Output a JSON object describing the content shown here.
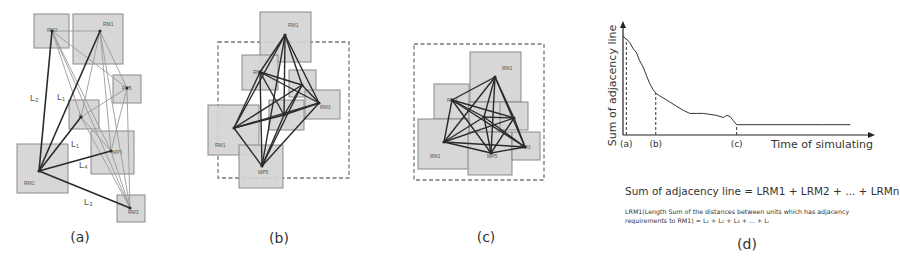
{
  "figure": {
    "colors": {
      "room_fill": "#d4d4d4",
      "room_stroke": "#8a8a8a",
      "edge_dark": "#2a2a2a",
      "edge_light": "#9a9a9a",
      "boundary": "#777777"
    },
    "panels": [
      {
        "id": "a",
        "caption": "(a)",
        "rooms": [
          {
            "label": "RM2",
            "x": 34,
            "y": 14,
            "w": 35,
            "h": 34,
            "lx": 47,
            "ly": 32
          },
          {
            "label": "RM1",
            "x": 73,
            "y": 14,
            "w": 50,
            "h": 50,
            "lx": 103,
            "ly": 26
          },
          {
            "label": "PV5",
            "x": 113,
            "y": 75,
            "w": 28,
            "h": 28,
            "lx": 122,
            "ly": 90
          },
          {
            "label": "B",
            "x": 69,
            "y": 100,
            "w": 30,
            "h": 29,
            "lx": 79,
            "ly": 118
          },
          {
            "label": "MP5",
            "x": 91,
            "y": 131,
            "w": 43,
            "h": 43,
            "lx": 112,
            "ly": 154
          },
          {
            "label": "RM1",
            "x": 17,
            "y": 144,
            "w": 51,
            "h": 49,
            "lx": 24,
            "ly": 185
          },
          {
            "label": "RM3",
            "x": 117,
            "y": 195,
            "w": 28,
            "h": 27,
            "lx": 128,
            "ly": 214
          }
        ],
        "nodes": [
          [
            52,
            31
          ],
          [
            100,
            31
          ],
          [
            127,
            88
          ],
          [
            81,
            117
          ],
          [
            111,
            151
          ],
          [
            39,
            171
          ],
          [
            130,
            208
          ]
        ],
        "dark_edges": [
          [
            5,
            0
          ],
          [
            5,
            1
          ],
          [
            5,
            3
          ],
          [
            5,
            4
          ],
          [
            5,
            6
          ]
        ],
        "light_edges": [
          [
            0,
            1
          ],
          [
            0,
            2
          ],
          [
            0,
            4
          ],
          [
            0,
            6
          ],
          [
            0,
            3
          ],
          [
            1,
            2
          ],
          [
            1,
            3
          ],
          [
            1,
            4
          ],
          [
            1,
            6
          ],
          [
            2,
            3
          ],
          [
            2,
            4
          ],
          [
            2,
            6
          ],
          [
            3,
            6
          ],
          [
            4,
            6
          ],
          [
            3,
            4
          ]
        ],
        "length_labels": [
          {
            "text": "L₂",
            "x": 30,
            "y": 101
          },
          {
            "text": "L₁",
            "x": 57,
            "y": 100
          },
          {
            "text": "L₁",
            "x": 71,
            "y": 147
          },
          {
            "text": "L₄",
            "x": 79,
            "y": 168
          },
          {
            "text": "L₃",
            "x": 84,
            "y": 205
          }
        ]
      },
      {
        "id": "b",
        "caption": "(b)",
        "boundary": {
          "x": 218,
          "y": 42,
          "w": 131,
          "h": 136
        },
        "rooms": [
          {
            "label": "RM1",
            "x": 260,
            "y": 12,
            "w": 51,
            "h": 50,
            "lx": 288,
            "ly": 27
          },
          {
            "label": "RM2",
            "x": 242,
            "y": 55,
            "w": 36,
            "h": 35,
            "lx": 253,
            "ly": 74
          },
          {
            "label": "",
            "x": 289,
            "y": 70,
            "w": 27,
            "h": 27,
            "lx": 0,
            "ly": 0
          },
          {
            "label": "RM3",
            "x": 305,
            "y": 90,
            "w": 35,
            "h": 29,
            "lx": 320,
            "ly": 109
          },
          {
            "label": "",
            "x": 269,
            "y": 100,
            "w": 35,
            "h": 30,
            "lx": 0,
            "ly": 0
          },
          {
            "label": "RM1",
            "x": 208,
            "y": 105,
            "w": 51,
            "h": 50,
            "lx": 215,
            "ly": 147
          },
          {
            "label": "MP5",
            "x": 239,
            "y": 145,
            "w": 44,
            "h": 43,
            "lx": 258,
            "ly": 174
          }
        ],
        "nodes": [
          [
            285,
            35
          ],
          [
            260,
            72
          ],
          [
            302,
            85
          ],
          [
            319,
            103
          ],
          [
            284,
            115
          ],
          [
            234,
            128
          ],
          [
            262,
            166
          ]
        ],
        "dark_edges": [
          [
            0,
            1
          ],
          [
            0,
            2
          ],
          [
            0,
            3
          ],
          [
            0,
            4
          ],
          [
            0,
            5
          ],
          [
            0,
            6
          ],
          [
            1,
            2
          ],
          [
            1,
            3
          ],
          [
            1,
            4
          ],
          [
            1,
            5
          ],
          [
            1,
            6
          ],
          [
            2,
            3
          ],
          [
            2,
            4
          ],
          [
            2,
            5
          ],
          [
            2,
            6
          ],
          [
            3,
            4
          ],
          [
            3,
            5
          ],
          [
            3,
            6
          ],
          [
            4,
            5
          ],
          [
            4,
            6
          ],
          [
            5,
            6
          ]
        ],
        "light_edges": []
      },
      {
        "id": "c",
        "caption": "(c)",
        "boundary": {
          "x": 414,
          "y": 44,
          "w": 130,
          "h": 136
        },
        "rooms": [
          {
            "label": "RM1",
            "x": 470,
            "y": 52,
            "w": 51,
            "h": 50,
            "lx": 502,
            "ly": 70
          },
          {
            "label": "RM2",
            "x": 434,
            "y": 84,
            "w": 35,
            "h": 35,
            "lx": 447,
            "ly": 102
          },
          {
            "label": "",
            "x": 469,
            "y": 102,
            "w": 35,
            "h": 30,
            "lx": 0,
            "ly": 0
          },
          {
            "label": "",
            "x": 500,
            "y": 102,
            "w": 28,
            "h": 28,
            "lx": 0,
            "ly": 0
          },
          {
            "label": "RM1",
            "x": 418,
            "y": 119,
            "w": 51,
            "h": 50,
            "lx": 430,
            "ly": 158
          },
          {
            "label": "MP5",
            "x": 468,
            "y": 132,
            "w": 44,
            "h": 43,
            "lx": 487,
            "ly": 158
          },
          {
            "label": "RM3",
            "x": 512,
            "y": 132,
            "w": 28,
            "h": 28,
            "lx": 520,
            "ly": 149
          }
        ],
        "nodes": [
          [
            495,
            77
          ],
          [
            452,
            100
          ],
          [
            484,
            117
          ],
          [
            514,
            118
          ],
          [
            444,
            142
          ],
          [
            491,
            153
          ],
          [
            525,
            147
          ]
        ],
        "dark_edges": [
          [
            0,
            1
          ],
          [
            0,
            2
          ],
          [
            0,
            3
          ],
          [
            0,
            4
          ],
          [
            0,
            5
          ],
          [
            0,
            6
          ],
          [
            1,
            2
          ],
          [
            1,
            3
          ],
          [
            1,
            4
          ],
          [
            1,
            5
          ],
          [
            1,
            6
          ],
          [
            2,
            3
          ],
          [
            2,
            4
          ],
          [
            2,
            5
          ],
          [
            2,
            6
          ],
          [
            3,
            4
          ],
          [
            3,
            5
          ],
          [
            3,
            6
          ],
          [
            4,
            5
          ],
          [
            4,
            6
          ],
          [
            5,
            6
          ]
        ],
        "light_edges": []
      }
    ],
    "panel_d_caption": "(d)",
    "formula_main": "Sum of adjacency line = LRM1 + LRM2 + ... + LRMn",
    "formula_sub": "LRM1(Length Sum of the distances between units which has adjacency requirements to RM1) = L₁ + L₂ + L₃ + ... + Lᵢ"
  },
  "chart_data": {
    "type": "line",
    "title": "",
    "xlabel": "Time of simulating",
    "ylabel": "Sum of adjacency line",
    "grid": false,
    "x_ticks": [
      {
        "label": "(a)",
        "x": 0.05
      },
      {
        "label": "(b)",
        "x": 0.49
      },
      {
        "label": "(c)",
        "x": 1.7
      }
    ],
    "xlim": [
      0,
      3.65
    ],
    "ylim": [
      0,
      1
    ],
    "series": [
      {
        "name": "Sum of adjacency line",
        "x": [
          0.0,
          0.05,
          0.1,
          0.15,
          0.2,
          0.25,
          0.3,
          0.35,
          0.4,
          0.45,
          0.5,
          0.55,
          0.6,
          0.7,
          0.8,
          0.9,
          1.0,
          1.1,
          1.2,
          1.3,
          1.4,
          1.5,
          1.55,
          1.6,
          1.65,
          1.7,
          1.9,
          2.5,
          3.0,
          3.4
        ],
        "y": [
          0.96,
          0.93,
          0.9,
          0.84,
          0.8,
          0.72,
          0.66,
          0.58,
          0.5,
          0.44,
          0.4,
          0.38,
          0.36,
          0.32,
          0.28,
          0.24,
          0.21,
          0.21,
          0.21,
          0.2,
          0.19,
          0.17,
          0.19,
          0.18,
          0.14,
          0.1,
          0.1,
          0.1,
          0.1,
          0.1
        ]
      }
    ],
    "markers": [
      {
        "label": "(a)",
        "x": 0.05,
        "style": "dashed-vertical"
      },
      {
        "label": "(b)",
        "x": 0.49,
        "style": "dashed-vertical"
      },
      {
        "label": "(c)",
        "x": 1.7,
        "style": "dashed-vertical"
      }
    ]
  }
}
